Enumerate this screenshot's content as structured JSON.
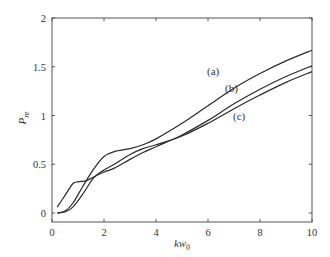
{
  "chart_data": {
    "type": "line",
    "title": "",
    "xlabel": "kw0",
    "xlabel_main": "kw",
    "xlabel_sub": "0",
    "ylabel": "P_re",
    "ylabel_main": "P",
    "ylabel_sub": "re",
    "xlim": [
      0,
      10
    ],
    "ylim": [
      0,
      2
    ],
    "xticks": [
      0,
      2,
      4,
      6,
      8,
      10
    ],
    "xtick_labels": [
      "0",
      "2",
      "4",
      "6",
      "8",
      "10"
    ],
    "yticks": [
      0,
      0.5,
      1,
      1.5,
      2
    ],
    "ytick_labels": [
      "0",
      "0.5",
      "1",
      "1.5",
      "2"
    ],
    "grid": false,
    "legend": "inline annotations",
    "series": [
      {
        "name": "(a)",
        "x": [
          0.2,
          0.5,
          0.8,
          1.2,
          1.6,
          2.0,
          2.4,
          3.0,
          3.5,
          4.0,
          5.0,
          6.0,
          7.0,
          8.0,
          9.0,
          10.0
        ],
        "y": [
          0.0,
          0.02,
          0.1,
          0.28,
          0.45,
          0.58,
          0.63,
          0.66,
          0.7,
          0.76,
          0.92,
          1.1,
          1.28,
          1.43,
          1.56,
          1.67
        ],
        "label_pos": [
          6.2,
          1.42
        ]
      },
      {
        "name": "(b)",
        "x": [
          0.2,
          0.5,
          0.8,
          1.0,
          1.3,
          1.6,
          2.0,
          2.4,
          3.0,
          3.5,
          4.0,
          5.0,
          6.0,
          7.0,
          8.0,
          9.0,
          10.0
        ],
        "y": [
          0.06,
          0.18,
          0.3,
          0.32,
          0.33,
          0.37,
          0.42,
          0.46,
          0.55,
          0.62,
          0.68,
          0.8,
          0.95,
          1.12,
          1.27,
          1.4,
          1.51
        ],
        "label_pos": [
          6.9,
          1.24
        ]
      },
      {
        "name": "(c)",
        "x": [
          0.2,
          0.5,
          0.8,
          1.2,
          1.6,
          2.0,
          2.4,
          3.0,
          3.5,
          4.0,
          5.0,
          6.0,
          7.0,
          8.0,
          9.0,
          10.0
        ],
        "y": [
          0.0,
          0.01,
          0.06,
          0.2,
          0.36,
          0.44,
          0.5,
          0.6,
          0.66,
          0.7,
          0.79,
          0.92,
          1.07,
          1.21,
          1.34,
          1.45
        ],
        "label_pos": [
          7.2,
          0.95
        ]
      }
    ]
  },
  "layout": {
    "plot_left": 52,
    "plot_right": 312,
    "plot_top": 18,
    "plot_bottom": 222,
    "y_zero_px": 213,
    "y_two_px": 18
  }
}
